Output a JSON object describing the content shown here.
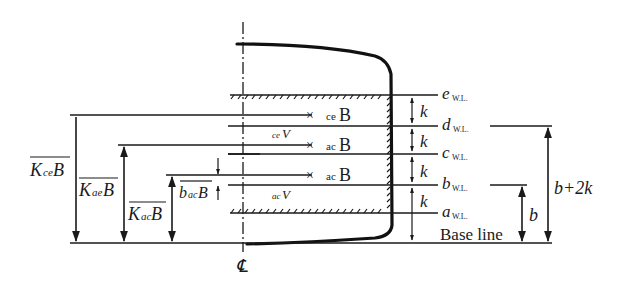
{
  "diagram": {
    "waterlines": [
      {
        "id": "e",
        "letter": "e",
        "sub": "W.L.",
        "y": 150
      },
      {
        "id": "d",
        "letter": "d",
        "sub": "W.L.",
        "y": 126
      },
      {
        "id": "c",
        "letter": "c",
        "sub": "W.L.",
        "y": 154
      },
      {
        "id": "b",
        "letter": "b",
        "sub": "W.L.",
        "y": 185
      },
      {
        "id": "a",
        "letter": "a",
        "sub": "W.L.",
        "y": 213
      }
    ],
    "spacing_labels": [
      "k",
      "k",
      "k",
      "k"
    ],
    "centers": [
      {
        "marker": "×",
        "pre": "ce",
        "label": "B"
      },
      {
        "marker": "×",
        "pre": "ac",
        "label": "B"
      },
      {
        "marker": "×",
        "pre": "ac",
        "label": "B"
      }
    ],
    "volumes": [
      {
        "pre": "ce",
        "label": "V"
      },
      {
        "pre": "ac",
        "label": "V"
      }
    ],
    "left_dimensions": [
      {
        "main": "K",
        "sub": "ce",
        "tail": "B"
      },
      {
        "main": "K",
        "sub": "ae",
        "tail": "B"
      },
      {
        "main": "K",
        "sub": "ac",
        "tail": "B"
      },
      {
        "main": "b",
        "sub": "ac",
        "tail": "B"
      }
    ],
    "right_dimensions": {
      "small": "b",
      "large": "b+2k"
    },
    "base_line_label": "Base line",
    "centerline_symbol": "℄"
  }
}
